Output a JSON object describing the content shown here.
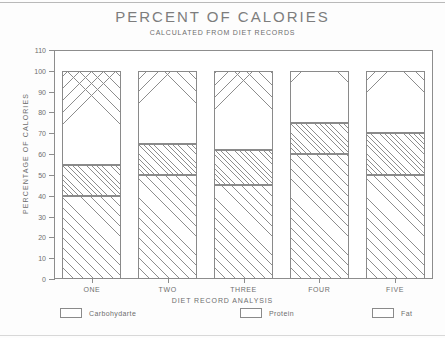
{
  "chart_data": {
    "type": "bar",
    "stacked": true,
    "title": "PERCENT OF CALORIES",
    "subtitle": "CALCULATED FROM DIET RECORDS",
    "xlabel": "DIET RECORD ANALYSIS",
    "ylabel": "PERCENTAGE OF CALORIES",
    "categories": [
      "ONE",
      "TWO",
      "THREE",
      "FOUR",
      "FIVE"
    ],
    "ylim": [
      0,
      110
    ],
    "yticks": [
      0,
      10,
      20,
      30,
      40,
      50,
      60,
      70,
      80,
      90,
      100,
      110
    ],
    "grid": false,
    "legend_position": "bottom",
    "series": [
      {
        "name": "Carbohydarte",
        "pattern": "diagonal-sparse",
        "values": [
          40,
          50,
          45,
          60,
          50
        ]
      },
      {
        "name": "Protein",
        "pattern": "diagonal-dense",
        "values": [
          15,
          15,
          17,
          15,
          20
        ]
      },
      {
        "name": "Fat",
        "pattern": "cross-hatch",
        "values": [
          45,
          35,
          38,
          25,
          30
        ]
      }
    ],
    "cumulative_tops": [
      {
        "category": "ONE",
        "carb_top": 40,
        "protein_top": 55,
        "fat_top": 100
      },
      {
        "category": "TWO",
        "carb_top": 50,
        "protein_top": 65,
        "fat_top": 100
      },
      {
        "category": "THREE",
        "carb_top": 45,
        "protein_top": 62,
        "fat_top": 100
      },
      {
        "category": "FOUR",
        "carb_top": 60,
        "protein_top": 75,
        "fat_top": 100
      },
      {
        "category": "FIVE",
        "carb_top": 50,
        "protein_top": 70,
        "fat_top": 100
      }
    ],
    "colors": {
      "line": "#8d8d8d",
      "text": "#6e6e6e",
      "background": "#ffffff"
    }
  }
}
